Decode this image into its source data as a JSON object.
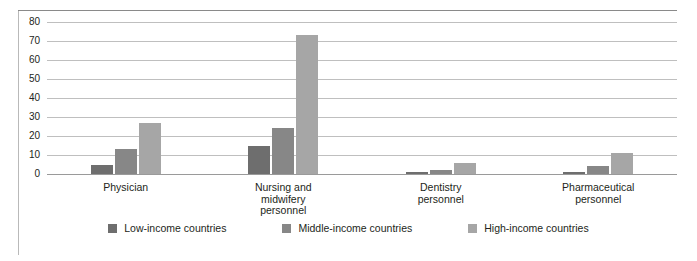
{
  "chart_data": {
    "type": "bar",
    "title": "",
    "subtitle": "",
    "xlabel": "",
    "ylabel": "",
    "ylim": [
      0,
      80
    ],
    "yticks": [
      80,
      70,
      60,
      50,
      40,
      30,
      20,
      10,
      0
    ],
    "grid": true,
    "legend_position": "bottom-center",
    "categories": [
      "Physician",
      "Nursing and midwifery personnel",
      "Dentistry personnel",
      "Pharmaceutical personnel"
    ],
    "category_lines": [
      [
        "Physician"
      ],
      [
        "Nursing and",
        "midwifery",
        "personnel"
      ],
      [
        "Dentistry",
        "personnel"
      ],
      [
        "Pharmaceutical",
        "personnel"
      ]
    ],
    "series": [
      {
        "name": "Low-income countries",
        "color": "#6e6e6e",
        "values": [
          5,
          15,
          1,
          1
        ]
      },
      {
        "name": "Middle-income countries",
        "color": "#878787",
        "values": [
          13,
          24,
          2,
          4
        ]
      },
      {
        "name": "High-income countries",
        "color": "#a6a6a6",
        "values": [
          27,
          73,
          6,
          11
        ]
      }
    ]
  },
  "legend": {
    "items": [
      {
        "label": "Low-income countries",
        "color": "#6e6e6e"
      },
      {
        "label": "Middle-income countries",
        "color": "#878787"
      },
      {
        "label": "High-income countries",
        "color": "#a6a6a6"
      }
    ]
  }
}
